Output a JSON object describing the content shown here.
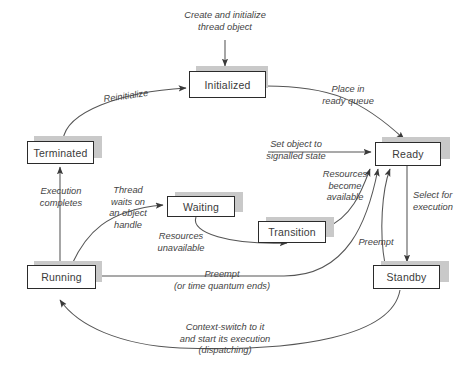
{
  "diagram": {
    "states": [
      {
        "name": "initialized",
        "label": "Initialized"
      },
      {
        "name": "ready",
        "label": "Ready"
      },
      {
        "name": "terminated",
        "label": "Terminated"
      },
      {
        "name": "waiting",
        "label": "Waiting"
      },
      {
        "name": "transition",
        "label": "Transition"
      },
      {
        "name": "running",
        "label": "Running"
      },
      {
        "name": "standby",
        "label": "Standby"
      }
    ],
    "labels": {
      "create": "Create and initialize\nthread object",
      "reinitialize": "Reinitialize",
      "place_in_ready_queue": "Place in\nready queue",
      "set_object_signalled": "Set object to\nsignalled state",
      "execution_completes": "Execution\ncompletes",
      "thread_waits": "Thread\nwaits on\nan object\nhandle",
      "resources_unavailable": "Resources\nunavailable",
      "resources_available": "Resources\nbecome\navailable",
      "select_for_execution": "Select for\nexecution",
      "preempt_standby": "Preempt",
      "preempt_running": "Preempt\n(or time quantum ends)",
      "context_switch": "Context-switch to it\nand start its execution\n(dispatching)"
    },
    "colors": {
      "box_border": "#2b2b2b",
      "box_fill": "#ffffff",
      "shadow": "#c9c9c9",
      "line": "#555555",
      "text": "#3a3a3a"
    }
  }
}
